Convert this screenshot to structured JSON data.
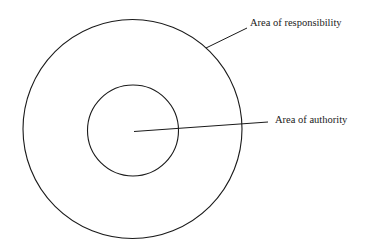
{
  "diagram": {
    "title": "",
    "labels": {
      "outer": "Area of responsibility",
      "inner": "Area of authority"
    },
    "colors": {
      "stroke": "#1a1a1a",
      "background": "#ffffff"
    }
  }
}
